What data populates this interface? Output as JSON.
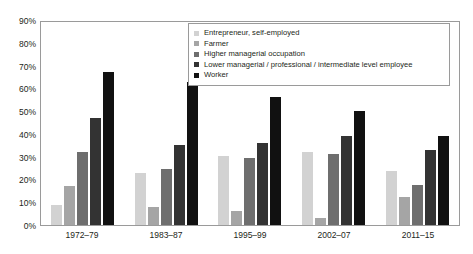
{
  "chart_data": {
    "type": "bar",
    "title": "",
    "subtitle": "",
    "xlabel": "",
    "ylabel": "",
    "ylim": [
      0,
      90
    ],
    "ytick_labels": [
      "90%",
      "80%",
      "70%",
      "60%",
      "50%",
      "40%",
      "30%",
      "20%",
      "10%",
      "0%"
    ],
    "ytick_values": [
      90,
      80,
      70,
      60,
      50,
      40,
      30,
      20,
      10,
      0
    ],
    "grid": false,
    "legend_position": "top-right",
    "categories": [
      "1972–79",
      "1983–87",
      "1995–99",
      "2002–07",
      "2011–15"
    ],
    "series": [
      {
        "name": "Entrepreneur, self-employed",
        "color": "#d2d2d2",
        "values": [
          9,
          23,
          30.5,
          32,
          23.5
        ]
      },
      {
        "name": "Farmer",
        "color": "#a5a5a5",
        "values": [
          17,
          8,
          6,
          3,
          12.5
        ]
      },
      {
        "name": "Higher managerial occupation",
        "color": "#6e6e6e",
        "values": [
          32,
          24.5,
          29.5,
          31,
          17.5
        ]
      },
      {
        "name": "Lower managerial / professional / intermediate level employee",
        "color": "#333333",
        "values": [
          47,
          35,
          36,
          39,
          33
        ]
      },
      {
        "name": "Worker",
        "color": "#111111",
        "values": [
          67,
          63,
          56,
          50,
          39
        ]
      }
    ]
  }
}
